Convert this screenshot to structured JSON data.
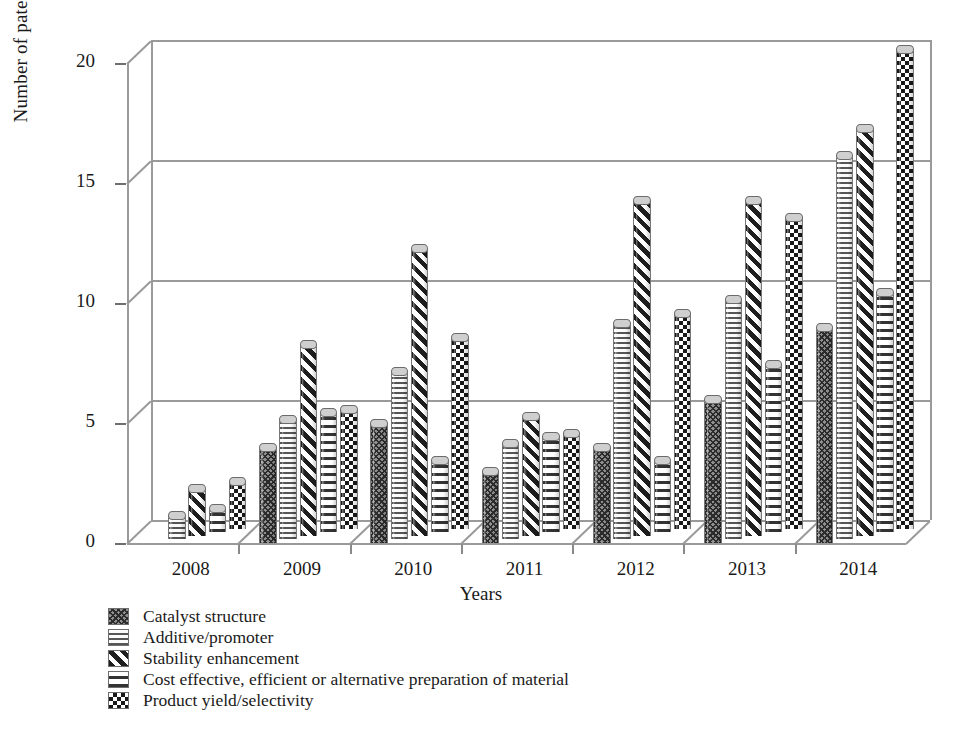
{
  "chart_data": {
    "type": "bar",
    "title": "",
    "xlabel": "Years",
    "ylabel": "Number of patents",
    "ylim": [
      0,
      20
    ],
    "yticks": [
      "0",
      "5",
      "10",
      "15",
      "20"
    ],
    "grid": true,
    "legend_position": "bottom-left",
    "style": "3d-cylinder-grouped-bars",
    "categories": [
      "2008",
      "2009",
      "2010",
      "2011",
      "2012",
      "2013",
      "2014"
    ],
    "series": [
      {
        "name": "Catalyst structure",
        "pattern": "crosshatch",
        "values": [
          0,
          4,
          5,
          3,
          4,
          6,
          9
        ]
      },
      {
        "name": "Additive/promoter",
        "pattern": "dots-light",
        "values": [
          1,
          5,
          7,
          4,
          9,
          10,
          16
        ]
      },
      {
        "name": "Stability enhancement",
        "pattern": "diagonal",
        "values": [
          2,
          8,
          12,
          5,
          14,
          14,
          17
        ]
      },
      {
        "name": "Cost effective, efficient or alternative preparation of material",
        "pattern": "dash-sparse",
        "values": [
          1,
          5,
          3,
          4,
          3,
          7,
          10
        ]
      },
      {
        "name": "Product yield/selectivity",
        "pattern": "checker",
        "values": [
          2,
          5,
          8,
          4,
          9,
          13,
          20
        ]
      }
    ]
  },
  "colors": {
    "axis": "#9a9a9a",
    "grid": "#9a9a9a",
    "text": "#1a1a1a",
    "background": "#ffffff"
  }
}
